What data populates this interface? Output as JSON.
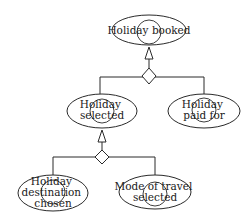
{
  "diagram": {
    "type": "goal-refinement-tree",
    "nodes": [
      {
        "id": "holiday_booked",
        "label_lines": [
          "Holiday booked"
        ]
      },
      {
        "id": "holiday_selected",
        "label_lines": [
          "Holiday",
          "selected"
        ]
      },
      {
        "id": "holiday_paid_for",
        "label_lines": [
          "Holiday",
          "paid for"
        ]
      },
      {
        "id": "holiday_destination_chosen",
        "label_lines": [
          "Holiday",
          "destination",
          "chosen"
        ]
      },
      {
        "id": "mode_of_travel_selected",
        "label_lines": [
          "Mode of travel",
          "selected"
        ]
      }
    ],
    "edges": [
      {
        "parent": "holiday_booked",
        "children": [
          "holiday_selected",
          "holiday_paid_for"
        ],
        "relation": "AND-refinement"
      },
      {
        "parent": "holiday_selected",
        "children": [
          "holiday_destination_chosen",
          "mode_of_travel_selected"
        ],
        "relation": "AND-refinement"
      }
    ],
    "colors": {
      "stroke": "#2a2a2a",
      "fill": "#ffffff",
      "text": "#1a1a1a"
    }
  }
}
